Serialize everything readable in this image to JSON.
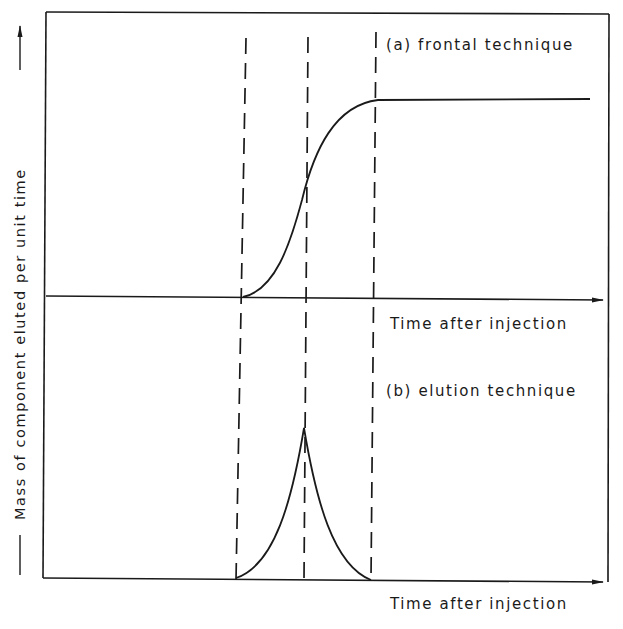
{
  "diagram": {
    "y_axis_label": "Mass of component eluted per unit time",
    "panels": [
      {
        "id": "a",
        "title": "(a) frontal technique",
        "x_axis_label": "Time after injection",
        "curve": "sigmoid (breakthrough) rising from baseline to plateau"
      },
      {
        "id": "b",
        "title": "(b) elution technique",
        "x_axis_label": "Time after injection",
        "curve": "sharp symmetric peak"
      }
    ],
    "guide_lines": [
      "start",
      "midpoint",
      "end"
    ],
    "colors": {
      "ink": "#1a1a1a",
      "background": "#ffffff"
    }
  }
}
